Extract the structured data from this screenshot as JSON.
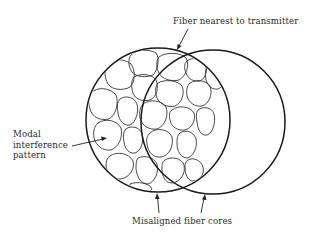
{
  "diagram": {
    "labels": {
      "top": "Fiber nearest to transmitter",
      "left_line1": "Modal",
      "left_line2": "interference",
      "left_line3": "pattern",
      "bottom": "Misaligned fiber cores"
    },
    "shapes": {
      "left_fiber_core": {
        "cx": 158,
        "cy": 120,
        "r": 72
      },
      "right_fiber_core": {
        "cx": 213,
        "cy": 122,
        "r": 72
      }
    },
    "arrows": [
      {
        "name": "arrow-to-near-fiber",
        "from": [
          188,
          29
        ],
        "to": [
          178,
          49
        ]
      },
      {
        "name": "arrow-to-pattern",
        "from": [
          72,
          146
        ],
        "to": [
          106,
          138
        ]
      },
      {
        "name": "arrow-to-left-core",
        "from": [
          159,
          214
        ],
        "to": [
          157,
          193
        ]
      },
      {
        "name": "arrow-to-right-core",
        "from": [
          201,
          214
        ],
        "to": [
          205,
          194
        ]
      }
    ],
    "colors": {
      "stroke": "#1a1a1a",
      "text": "#2a2a2a",
      "background": "#ffffff"
    }
  }
}
